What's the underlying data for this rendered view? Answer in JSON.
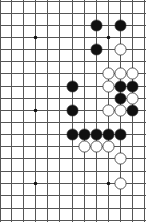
{
  "board": {
    "type": "go-board-fragment",
    "grid": {
      "x_lines": [
        0,
        11,
        23,
        35,
        47,
        59,
        72,
        84,
        96,
        108,
        120,
        132,
        144
      ],
      "y_lines": [
        1,
        13,
        25,
        37,
        49,
        61,
        73,
        86,
        98,
        110,
        122,
        134,
        146,
        158,
        171,
        183,
        195,
        208,
        220
      ],
      "line_color": "#555555"
    },
    "hoshi": [
      [
        3,
        3
      ],
      [
        9,
        3
      ],
      [
        3,
        9
      ],
      [
        3,
        15
      ],
      [
        9,
        15
      ]
    ],
    "stones": [
      {
        "color": "black",
        "col": 8,
        "row": 2
      },
      {
        "color": "black",
        "col": 10,
        "row": 2
      },
      {
        "color": "black",
        "col": 8,
        "row": 4
      },
      {
        "color": "white",
        "col": 10,
        "row": 4
      },
      {
        "color": "white",
        "col": 9,
        "row": 6
      },
      {
        "color": "white",
        "col": 10,
        "row": 6
      },
      {
        "color": "white",
        "col": 11,
        "row": 6
      },
      {
        "color": "black",
        "col": 6,
        "row": 7
      },
      {
        "color": "white",
        "col": 9,
        "row": 7
      },
      {
        "color": "black",
        "col": 10,
        "row": 7
      },
      {
        "color": "black",
        "col": 11,
        "row": 7
      },
      {
        "color": "black",
        "col": 10,
        "row": 8
      },
      {
        "color": "white",
        "col": 11,
        "row": 8
      },
      {
        "color": "black",
        "col": 6,
        "row": 9
      },
      {
        "color": "white",
        "col": 9,
        "row": 9
      },
      {
        "color": "white",
        "col": 10,
        "row": 9
      },
      {
        "color": "black",
        "col": 11,
        "row": 9
      },
      {
        "color": "black",
        "col": 6,
        "row": 11
      },
      {
        "color": "black",
        "col": 7,
        "row": 11
      },
      {
        "color": "black",
        "col": 8,
        "row": 11
      },
      {
        "color": "black",
        "col": 9,
        "row": 11
      },
      {
        "color": "black",
        "col": 10,
        "row": 11
      },
      {
        "color": "white",
        "col": 7,
        "row": 12
      },
      {
        "color": "white",
        "col": 8,
        "row": 12
      },
      {
        "color": "white",
        "col": 9,
        "row": 12
      },
      {
        "color": "white",
        "col": 10,
        "row": 13
      },
      {
        "color": "white",
        "col": 10,
        "row": 15
      }
    ],
    "colors": {
      "black": "#111111",
      "white": "#ffffff",
      "stone_outline": "#333333"
    }
  }
}
